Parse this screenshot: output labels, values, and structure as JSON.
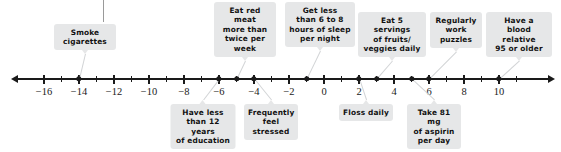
{
  "chart_data": {
    "type": "scatter",
    "title": "",
    "xlabel": "",
    "ylabel": "",
    "xlim": [
      -17.5,
      11.5
    ],
    "grid": false,
    "legend": null,
    "axis": {
      "tick_labels": [
        "-16",
        "-14",
        "-12",
        "-10",
        "-8",
        "-6",
        "-4",
        "-2",
        "0",
        "2",
        "4",
        "6",
        "8",
        "10"
      ],
      "tick_values": [
        -16,
        -14,
        -12,
        -10,
        -8,
        -6,
        -4,
        -2,
        0,
        2,
        4,
        6,
        8,
        10
      ],
      "minor_tick_values": [
        -15,
        -13,
        -11,
        -9,
        -7,
        -5,
        -3,
        -1,
        1,
        3,
        5,
        7,
        9,
        11
      ],
      "left_arrow": true,
      "right_arrow": true
    },
    "points": [
      {
        "label": "Smoke cigarettes",
        "value": -14,
        "position": "above"
      },
      {
        "label": "Have less than 12 years of education",
        "value": -6,
        "position": "below"
      },
      {
        "label": "Eat red meat more than twice per week",
        "value": -5,
        "position": "above"
      },
      {
        "label": "Frequently feel stressed",
        "value": -4,
        "position": "below"
      },
      {
        "label": "Get less than 6 to 8 hours of sleep per night",
        "value": -1,
        "position": "above"
      },
      {
        "label": "Floss daily",
        "value": 2,
        "position": "below"
      },
      {
        "label": "Eat 5 servings of fruits/ veggies daily",
        "value": 3,
        "position": "above"
      },
      {
        "label": "Take 81 mg of aspirin per day",
        "value": 5,
        "position": "below"
      },
      {
        "label": "Regularly work puzzles",
        "value": 6,
        "position": "above"
      },
      {
        "label": "Have a blood relative 95 or older",
        "value": 10,
        "position": "above"
      }
    ],
    "callouts": [
      {
        "text": "Smoke\ncigarettes",
        "value": -14,
        "position": "above",
        "box_center_x": 85,
        "width": 62,
        "top": 24,
        "dot_value": -14
      },
      {
        "text": "Eat red meat\nmore than\ntwice per\nweek",
        "value": -5,
        "position": "above",
        "box_center_x": 245,
        "width": 62,
        "top": 2,
        "dot_value": -5
      },
      {
        "text": "Get less\nthan 6 to 8\nhours of sleep\nper night",
        "value": -1,
        "position": "above",
        "box_center_x": 320,
        "width": 70,
        "top": 2,
        "dot_value": -1
      },
      {
        "text": "Eat 5 servings\nof fruits/\nveggies daily",
        "value": 3,
        "position": "above",
        "box_center_x": 392,
        "width": 68,
        "top": 12,
        "dot_value": 3
      },
      {
        "text": "Regularly\nwork\npuzzles",
        "value": 6,
        "position": "above",
        "box_center_x": 456,
        "width": 52,
        "top": 12,
        "dot_value": 6
      },
      {
        "text": "Have a\nblood relative\n95 or older",
        "value": 10,
        "position": "above",
        "box_center_x": 519,
        "width": 66,
        "top": 12,
        "dot_value": 10
      },
      {
        "text": "Have less\nthan 12 years\nof education",
        "value": -6,
        "position": "below",
        "box_center_x": 203,
        "width": 65,
        "top": 104,
        "dot_value": -6
      },
      {
        "text": "Frequently\nfeel\nstressed",
        "value": -4,
        "position": "below",
        "box_center_x": 271,
        "width": 54,
        "top": 104,
        "dot_value": -4
      },
      {
        "text": "Floss daily",
        "value": 2,
        "position": "below",
        "box_center_x": 366,
        "width": 54,
        "top": 104,
        "dot_value": 2
      },
      {
        "text": "Take 81 mg\nof aspirin\nper day",
        "value": 5,
        "position": "below",
        "box_center_x": 434,
        "width": 54,
        "top": 104,
        "dot_value": 5
      }
    ]
  },
  "geometry": {
    "axis_y": 79,
    "origin_x": 324,
    "px_per_unit": 17.5,
    "axis_start_x": 18,
    "axis_end_x": 548,
    "top_rule_x": 103,
    "top_rule_top": 0,
    "top_rule_height": 22
  }
}
